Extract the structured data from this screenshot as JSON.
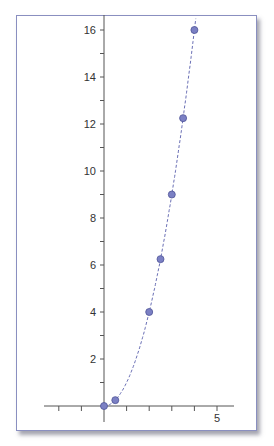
{
  "chart_data": {
    "type": "scatter",
    "title": "",
    "xlabel": "",
    "ylabel": "",
    "x": [
      0,
      0.5,
      2,
      2.5,
      3,
      3.5,
      4
    ],
    "y": [
      0,
      0.25,
      4,
      6.25,
      9,
      12.25,
      16
    ],
    "curve": "y = x^2 (dashed fit)",
    "xlim": [
      -2.2,
      5.5
    ],
    "ylim": [
      0,
      16.5
    ],
    "x_ticks": [
      -2,
      -1,
      1,
      2,
      3,
      4,
      5
    ],
    "x_tick_labels": {
      "5": "5"
    },
    "y_ticks": [
      1,
      2,
      3,
      4,
      5,
      6,
      7,
      8,
      9,
      10,
      11,
      12,
      13,
      14,
      15,
      16
    ],
    "y_tick_labels": [
      "2",
      "4",
      "6",
      "8",
      "10",
      "12",
      "14",
      "16"
    ],
    "grid": false,
    "legend": null,
    "colors": {
      "marker": "#7b80c4",
      "marker_edge": "#4f5497",
      "curve": "#6a6fb5",
      "axis": "#555555",
      "frame": "#8a8fc0"
    }
  }
}
